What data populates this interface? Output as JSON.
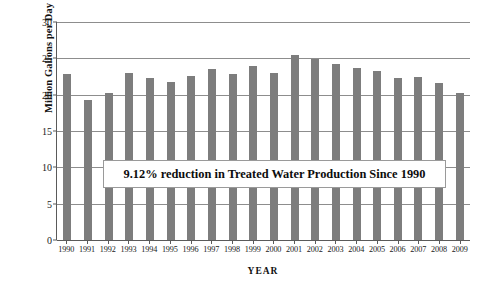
{
  "chart_data": {
    "type": "bar",
    "title": "",
    "xlabel": "YEAR",
    "ylabel": "Million Gallons per Day (MGD)",
    "categories": [
      "1990",
      "1991",
      "1992",
      "1993",
      "1994",
      "1995",
      "1996",
      "1997",
      "1998",
      "1999",
      "2000",
      "2001",
      "2002",
      "2003",
      "2004",
      "2005",
      "2006",
      "2007",
      "2008",
      "2009"
    ],
    "values": [
      22.9,
      19.3,
      20.3,
      23.0,
      22.3,
      21.8,
      22.6,
      23.5,
      22.8,
      23.9,
      23.0,
      25.4,
      24.9,
      24.2,
      23.7,
      23.3,
      22.3,
      22.4,
      21.6,
      20.2
    ],
    "ylim": [
      0,
      30
    ],
    "yticks": [
      0,
      5,
      10,
      15,
      20,
      25,
      30
    ],
    "ytick_labels": [
      "0",
      "5",
      "10",
      "15",
      "20",
      "25",
      "30"
    ],
    "grid": true,
    "legend": "none",
    "bar_color": "#7d7d7d",
    "annotations": [
      {
        "text": "9.12% reduction in Treated Water Production Since 1990"
      }
    ]
  }
}
